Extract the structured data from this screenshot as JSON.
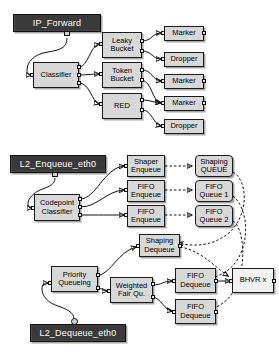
{
  "diagram": {
    "background": "#ffffff",
    "colors": {
      "node_fill": "#d8d8d8",
      "node_fill_light": "#f2f2f2",
      "titlebar_fill": "#3a3a3a",
      "titlebar_text": "#ffffff",
      "stroke": "#111111",
      "port_fill": "#e9e9e9"
    }
  },
  "titlebars": [
    {
      "id": "ip-forward",
      "label": "IP_Forward"
    },
    {
      "id": "l2-enqueue-eth0",
      "label": "L2_Enqueue_eth0"
    },
    {
      "id": "l2-dequeue-eth0",
      "label": "L2_Dequeue_eth0"
    }
  ],
  "nodes": {
    "classifier": {
      "label": "Classifier"
    },
    "leaky_bucket": {
      "label": "Leaky\nBucket"
    },
    "token_bucket": {
      "label": "Token\nBucket"
    },
    "red": {
      "label": "RED"
    },
    "marker_1": {
      "label": "Marker"
    },
    "dropper_1": {
      "label": "Dropper"
    },
    "marker_2": {
      "label": "Marker"
    },
    "marker_3": {
      "label": "Marker"
    },
    "dropper_2": {
      "label": "Dropper"
    },
    "codepoint_classifier": {
      "label": "Codepoint\nClassifier"
    },
    "shaper_enqueue": {
      "label": "Shaper\nEnqueue"
    },
    "fifo_enqueue_1": {
      "label": "FIFO\nEnqueue"
    },
    "fifo_enqueue_2": {
      "label": "FIFO\nEnqueue"
    },
    "shaping_queue": {
      "label": "Shaping\nQUEUE"
    },
    "fifo_queue_1": {
      "label": "FIFO\nQueue 1"
    },
    "fifo_queue_2": {
      "label": "FIFO\nQueue 2"
    },
    "shaping_dequeue": {
      "label": "Shaping\nDequeue"
    },
    "priority_queueing": {
      "label": "Priority\nQueueing"
    },
    "weighted_fair_qu": {
      "label": "Weighted\nFair Qu."
    },
    "fifo_dequeue_1": {
      "label": "FIFO\nDequeue"
    },
    "fifo_dequeue_2": {
      "label": "FIFO\nDequeue"
    },
    "bhvr": {
      "label": "BHVR x"
    }
  }
}
